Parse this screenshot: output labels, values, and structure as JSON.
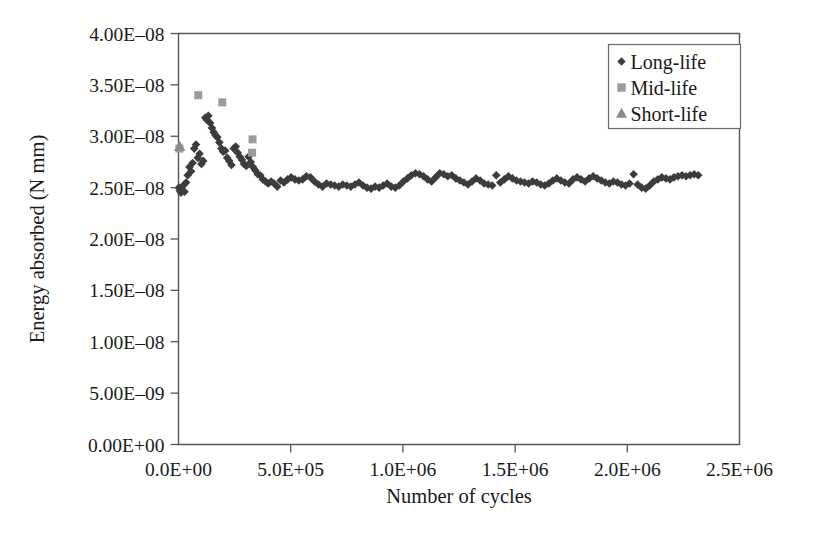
{
  "figure": {
    "xlabel": "Number of cycles",
    "ylabel": "Energy absorbed (N mm)",
    "caption": ""
  },
  "legend": {
    "position": "top-right",
    "items": [
      {
        "label": "Long-life",
        "marker": "diamond-marker",
        "color": "#3c3c3c"
      },
      {
        "label": "Mid-life",
        "marker": "square-marker",
        "color": "#9b9b9b"
      },
      {
        "label": "Short-life",
        "marker": "triangle-marker",
        "color": "#8a8a8a"
      }
    ]
  },
  "yaxis": {
    "ticks": [
      "0.00E+00",
      "5.00E–09",
      "1.00E–08",
      "1.50E–08",
      "2.00E–08",
      "2.50E–08",
      "3.00E–08",
      "3.50E–08",
      "4.00E–08"
    ],
    "min": 0,
    "max": 4e-08
  },
  "xaxis": {
    "ticks": [
      "0.0E+00",
      "5.0E+05",
      "1.0E+06",
      "1.5E+06",
      "2.0E+06",
      "2.5E+06"
    ],
    "min": 0,
    "max": 2500000.0
  },
  "chart_data": {
    "type": "scatter",
    "title": "",
    "xlabel": "Number of cycles",
    "ylabel": "Energy absorbed (N mm)",
    "xlim": [
      0,
      2500000
    ],
    "ylim": [
      0,
      4e-08
    ],
    "grid": false,
    "legend_position": "top-right",
    "series": [
      {
        "name": "Long-life",
        "marker": "diamond",
        "color": "#3c3c3c",
        "points": [
          [
            2000,
            2.5e-08
          ],
          [
            6000,
            2.47e-08
          ],
          [
            11000,
            2.45e-08
          ],
          [
            16000,
            2.48e-08
          ],
          [
            21000,
            2.52e-08
          ],
          [
            27000,
            2.46e-08
          ],
          [
            34000,
            2.55e-08
          ],
          [
            41000,
            2.62e-08
          ],
          [
            49000,
            2.7e-08
          ],
          [
            56000,
            2.66e-08
          ],
          [
            63000,
            2.74e-08
          ],
          [
            70000,
            2.88e-08
          ],
          [
            78000,
            2.92e-08
          ],
          [
            86000,
            2.79e-08
          ],
          [
            94000,
            2.83e-08
          ],
          [
            102000,
            2.73e-08
          ],
          [
            110000,
            2.76e-08
          ],
          [
            119000,
            3.18e-08
          ],
          [
            126000,
            3.16e-08
          ],
          [
            133000,
            3.2e-08
          ],
          [
            141000,
            3.13e-08
          ],
          [
            149000,
            3.08e-08
          ],
          [
            157000,
            3.04e-08
          ],
          [
            165000,
            3.01e-08
          ],
          [
            173000,
            2.99e-08
          ],
          [
            182000,
            2.94e-08
          ],
          [
            191000,
            2.88e-08
          ],
          [
            199000,
            2.85e-08
          ],
          [
            208000,
            2.86e-08
          ],
          [
            217000,
            2.79e-08
          ],
          [
            226000,
            2.76e-08
          ],
          [
            236000,
            2.72e-08
          ],
          [
            246000,
            2.88e-08
          ],
          [
            255000,
            2.9e-08
          ],
          [
            264000,
            2.84e-08
          ],
          [
            273000,
            2.8e-08
          ],
          [
            283000,
            2.77e-08
          ],
          [
            292000,
            2.73e-08
          ],
          [
            302000,
            2.71e-08
          ],
          [
            312000,
            2.8e-08
          ],
          [
            322000,
            2.75e-08
          ],
          [
            332000,
            2.7e-08
          ],
          [
            342000,
            2.67e-08
          ],
          [
            353000,
            2.63e-08
          ],
          [
            364000,
            2.62e-08
          ],
          [
            376000,
            2.58e-08
          ],
          [
            388000,
            2.56e-08
          ],
          [
            400000,
            2.54e-08
          ],
          [
            413000,
            2.56e-08
          ],
          [
            426000,
            2.54e-08
          ],
          [
            440000,
            2.51e-08
          ],
          [
            455000,
            2.57e-08
          ],
          [
            470000,
            2.55e-08
          ],
          [
            486000,
            2.58e-08
          ],
          [
            502000,
            2.6e-08
          ],
          [
            519000,
            2.58e-08
          ],
          [
            536000,
            2.57e-08
          ],
          [
            553000,
            2.58e-08
          ],
          [
            570000,
            2.61e-08
          ],
          [
            588000,
            2.6e-08
          ],
          [
            606000,
            2.56e-08
          ],
          [
            624000,
            2.53e-08
          ],
          [
            642000,
            2.51e-08
          ],
          [
            660000,
            2.54e-08
          ],
          [
            678000,
            2.53e-08
          ],
          [
            696000,
            2.52e-08
          ],
          [
            714000,
            2.51e-08
          ],
          [
            732000,
            2.53e-08
          ],
          [
            750000,
            2.52e-08
          ],
          [
            768000,
            2.51e-08
          ],
          [
            786000,
            2.53e-08
          ],
          [
            804000,
            2.55e-08
          ],
          [
            822000,
            2.52e-08
          ],
          [
            840000,
            2.5e-08
          ],
          [
            858000,
            2.49e-08
          ],
          [
            876000,
            2.51e-08
          ],
          [
            894000,
            2.5e-08
          ],
          [
            912000,
            2.52e-08
          ],
          [
            930000,
            2.54e-08
          ],
          [
            948000,
            2.51e-08
          ],
          [
            966000,
            2.5e-08
          ],
          [
            984000,
            2.52e-08
          ],
          [
            1002000,
            2.56e-08
          ],
          [
            1020000,
            2.59e-08
          ],
          [
            1038000,
            2.62e-08
          ],
          [
            1056000,
            2.64e-08
          ],
          [
            1074000,
            2.63e-08
          ],
          [
            1092000,
            2.61e-08
          ],
          [
            1110000,
            2.58e-08
          ],
          [
            1128000,
            2.56e-08
          ],
          [
            1146000,
            2.6e-08
          ],
          [
            1164000,
            2.64e-08
          ],
          [
            1182000,
            2.63e-08
          ],
          [
            1200000,
            2.61e-08
          ],
          [
            1218000,
            2.62e-08
          ],
          [
            1236000,
            2.59e-08
          ],
          [
            1254000,
            2.57e-08
          ],
          [
            1272000,
            2.55e-08
          ],
          [
            1290000,
            2.53e-08
          ],
          [
            1308000,
            2.56e-08
          ],
          [
            1326000,
            2.59e-08
          ],
          [
            1344000,
            2.57e-08
          ],
          [
            1362000,
            2.54e-08
          ],
          [
            1380000,
            2.53e-08
          ],
          [
            1398000,
            2.52e-08
          ],
          [
            1416000,
            2.62e-08
          ],
          [
            1434000,
            2.55e-08
          ],
          [
            1452000,
            2.58e-08
          ],
          [
            1470000,
            2.61e-08
          ],
          [
            1488000,
            2.59e-08
          ],
          [
            1506000,
            2.57e-08
          ],
          [
            1524000,
            2.56e-08
          ],
          [
            1542000,
            2.55e-08
          ],
          [
            1560000,
            2.54e-08
          ],
          [
            1578000,
            2.56e-08
          ],
          [
            1596000,
            2.55e-08
          ],
          [
            1614000,
            2.53e-08
          ],
          [
            1632000,
            2.52e-08
          ],
          [
            1650000,
            2.54e-08
          ],
          [
            1668000,
            2.57e-08
          ],
          [
            1686000,
            2.59e-08
          ],
          [
            1704000,
            2.57e-08
          ],
          [
            1722000,
            2.55e-08
          ],
          [
            1740000,
            2.54e-08
          ],
          [
            1758000,
            2.58e-08
          ],
          [
            1776000,
            2.6e-08
          ],
          [
            1794000,
            2.58e-08
          ],
          [
            1812000,
            2.56e-08
          ],
          [
            1830000,
            2.59e-08
          ],
          [
            1848000,
            2.61e-08
          ],
          [
            1866000,
            2.59e-08
          ],
          [
            1884000,
            2.57e-08
          ],
          [
            1902000,
            2.55e-08
          ],
          [
            1920000,
            2.54e-08
          ],
          [
            1938000,
            2.56e-08
          ],
          [
            1956000,
            2.55e-08
          ],
          [
            1974000,
            2.53e-08
          ],
          [
            1992000,
            2.52e-08
          ],
          [
            2010000,
            2.54e-08
          ],
          [
            2028000,
            2.63e-08
          ],
          [
            2046000,
            2.53e-08
          ],
          [
            2064000,
            2.5e-08
          ],
          [
            2082000,
            2.49e-08
          ],
          [
            2100000,
            2.52e-08
          ],
          [
            2118000,
            2.56e-08
          ],
          [
            2136000,
            2.58e-08
          ],
          [
            2154000,
            2.6e-08
          ],
          [
            2172000,
            2.59e-08
          ],
          [
            2190000,
            2.58e-08
          ],
          [
            2208000,
            2.6e-08
          ],
          [
            2226000,
            2.61e-08
          ],
          [
            2244000,
            2.62e-08
          ],
          [
            2262000,
            2.61e-08
          ],
          [
            2280000,
            2.62e-08
          ],
          [
            2298000,
            2.63e-08
          ],
          [
            2316000,
            2.62e-08
          ]
        ]
      },
      {
        "name": "Mid-life",
        "marker": "square",
        "color": "#9b9b9b",
        "points": [
          [
            4000,
            2.88e-08
          ],
          [
            88000,
            3.4e-08
          ],
          [
            195000,
            3.33e-08
          ],
          [
            330000,
            2.97e-08
          ],
          [
            328000,
            2.84e-08
          ]
        ]
      },
      {
        "name": "Short-life",
        "marker": "triangle",
        "color": "#8a8a8a",
        "points": [
          [
            5000,
            2.9e-08
          ]
        ]
      }
    ]
  }
}
